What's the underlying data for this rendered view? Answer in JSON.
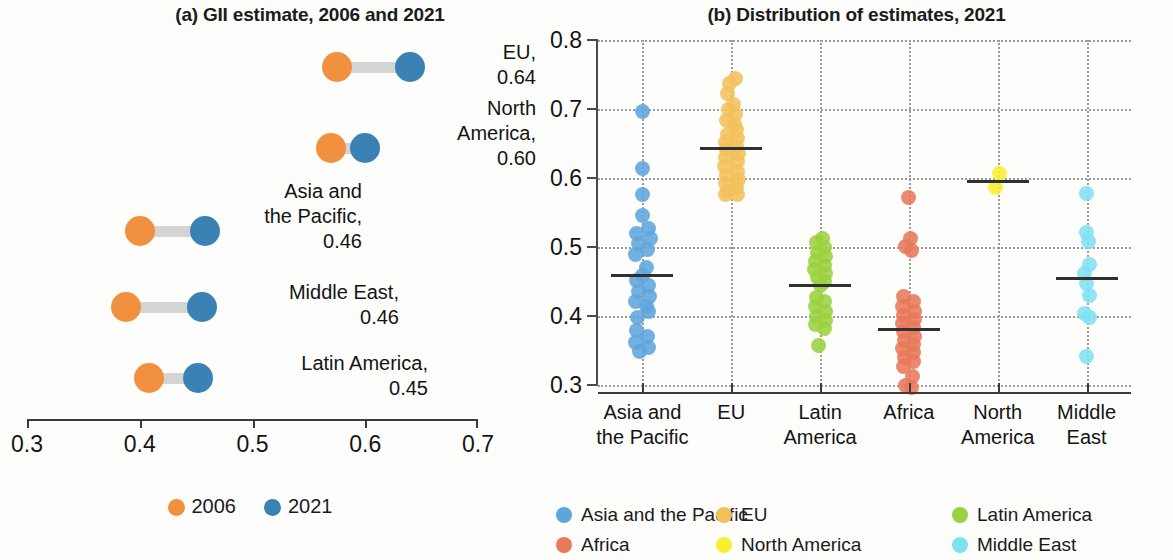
{
  "panel_a": {
    "title": "(a) GII estimate, 2006 and 2021",
    "axis": {
      "min": 0.3,
      "max": 0.7,
      "ticks": [
        "0.3",
        "0.4",
        "0.5",
        "0.6",
        "0.7"
      ]
    },
    "rows": [
      {
        "label": "EU,\n0.64",
        "v2006": 0.575,
        "v2021": 0.64,
        "top": 52,
        "label_x": 432,
        "label_y": 40,
        "label_w": 104
      },
      {
        "label": "North\nAmerica,\n0.60",
        "v2006": 0.57,
        "v2021": 0.6,
        "top": 133,
        "label_x": 400,
        "label_y": 96,
        "label_w": 136
      },
      {
        "label": "Asia and\nthe Pacific,\n0.46",
        "v2006": 0.4,
        "v2021": 0.458,
        "top": 216,
        "label_x": 222,
        "label_y": 179,
        "label_w": 140
      },
      {
        "label": "Middle East,\n0.46",
        "v2006": 0.388,
        "v2021": 0.455,
        "top": 292,
        "label_x": 224,
        "label_y": 280,
        "label_w": 175
      },
      {
        "label": "Latin America,\n0.45",
        "v2006": 0.408,
        "v2021": 0.452,
        "top": 363,
        "label_x": 228,
        "label_y": 351,
        "label_w": 200
      }
    ],
    "legend": [
      {
        "label": "2006",
        "color": "#f1913f"
      },
      {
        "label": "2021",
        "color": "#3a81b4"
      }
    ]
  },
  "panel_b": {
    "title": "(b) Distribution of estimates, 2021",
    "y_ticks": [
      "0.8",
      "0.7",
      "0.6",
      "0.5",
      "0.4",
      "0.3"
    ],
    "legend": [
      {
        "label": "Asia and the Pacific",
        "color": "#5ea5dd",
        "col": 0,
        "row": 0
      },
      {
        "label": "EU",
        "color": "#f2c05a",
        "col": 1,
        "row": 0
      },
      {
        "label": "Latin America",
        "color": "#9bd13f",
        "col": 2,
        "row": 0
      },
      {
        "label": "Africa",
        "color": "#e8795a",
        "col": 0,
        "row": 1
      },
      {
        "label": "North America",
        "color": "#f7ef2f",
        "col": 1,
        "row": 1
      },
      {
        "label": "Middle East",
        "color": "#7fe1f2",
        "col": 2,
        "row": 1
      }
    ]
  },
  "chart_data": [
    {
      "type": "bar",
      "subtype": "dumbbell",
      "title": "(a) GII estimate, 2006 and 2021",
      "xlabel": "",
      "ylabel": "",
      "xlim": [
        0.3,
        0.7
      ],
      "xticks": [
        0.3,
        0.4,
        0.5,
        0.6,
        0.7
      ],
      "grid": false,
      "legend_position": "bottom",
      "categories": [
        "EU",
        "North America",
        "Asia and the Pacific",
        "Middle East",
        "Latin America"
      ],
      "series": [
        {
          "name": "2006",
          "color": "#f1913f",
          "values": [
            0.575,
            0.57,
            0.4,
            0.388,
            0.408
          ]
        },
        {
          "name": "2021",
          "color": "#3a81b4",
          "values": [
            0.64,
            0.6,
            0.458,
            0.455,
            0.452
          ]
        }
      ],
      "data_labels": [
        "0.64",
        "0.60",
        "0.46",
        "0.46",
        "0.45"
      ]
    },
    {
      "type": "scatter",
      "subtype": "strip-beeswarm",
      "title": "(b) Distribution of estimates, 2021",
      "xlabel": "",
      "ylabel": "",
      "ylim": [
        0.3,
        0.8
      ],
      "yticks": [
        0.3,
        0.4,
        0.5,
        0.6,
        0.7,
        0.8
      ],
      "grid": true,
      "legend_position": "bottom",
      "categories": [
        "Asia and the Pacific",
        "EU",
        "Latin America",
        "Africa",
        "North America",
        "Middle East"
      ],
      "series": [
        {
          "name": "Asia and the Pacific",
          "color": "#5ea5dd",
          "mean": 0.458,
          "values": [
            0.697,
            0.614,
            0.576,
            0.545,
            0.527,
            0.52,
            0.512,
            0.505,
            0.497,
            0.489,
            0.47,
            0.459,
            0.452,
            0.444,
            0.435,
            0.428,
            0.421,
            0.414,
            0.406,
            0.398,
            0.379,
            0.371,
            0.362,
            0.355,
            0.348
          ],
          "offsets": [
            0,
            0,
            0,
            0,
            6,
            -6,
            8,
            -4,
            5,
            -7,
            4,
            0,
            -6,
            6,
            -4,
            7,
            -7,
            4,
            6,
            -5,
            -6,
            5,
            -7,
            6,
            -3
          ]
        },
        {
          "name": "EU",
          "color": "#f2c05a",
          "mean": 0.643,
          "values": [
            0.744,
            0.737,
            0.722,
            0.706,
            0.699,
            0.692,
            0.684,
            0.677,
            0.67,
            0.663,
            0.657,
            0.651,
            0.646,
            0.641,
            0.636,
            0.63,
            0.624,
            0.617,
            0.61,
            0.604,
            0.598,
            0.592,
            0.586,
            0.58,
            0.576,
            0.576
          ],
          "offsets": [
            4,
            -2,
            -4,
            2,
            -3,
            4,
            -5,
            3,
            5,
            -4,
            6,
            -6,
            5,
            -5,
            7,
            -6,
            6,
            -7,
            6,
            -5,
            7,
            -6,
            5,
            -4,
            6,
            -6
          ]
        },
        {
          "name": "Latin America",
          "color": "#9bd13f",
          "mean": 0.444,
          "values": [
            0.512,
            0.506,
            0.499,
            0.492,
            0.486,
            0.479,
            0.473,
            0.468,
            0.462,
            0.456,
            0.45,
            0.444,
            0.427,
            0.421,
            0.414,
            0.407,
            0.4,
            0.394,
            0.388,
            0.382,
            0.357
          ],
          "offsets": [
            2,
            -4,
            4,
            -3,
            5,
            -5,
            4,
            -6,
            5,
            -3,
            4,
            0,
            -4,
            4,
            -5,
            5,
            -4,
            5,
            -5,
            4,
            -2
          ]
        },
        {
          "name": "Africa",
          "color": "#e8795a",
          "mean": 0.38,
          "values": [
            0.572,
            0.512,
            0.501,
            0.495,
            0.428,
            0.421,
            0.414,
            0.407,
            0.401,
            0.395,
            0.389,
            0.383,
            0.377,
            0.371,
            0.365,
            0.359,
            0.353,
            0.347,
            0.34,
            0.334,
            0.327,
            0.313,
            0.3,
            0.296
          ],
          "offsets": [
            0,
            2,
            -3,
            3,
            -5,
            5,
            -6,
            6,
            -5,
            6,
            -6,
            5,
            -5,
            6,
            -4,
            5,
            -6,
            5,
            -4,
            5,
            -5,
            4,
            -3,
            3
          ]
        },
        {
          "name": "North America",
          "color": "#f7ef2f",
          "mean": 0.595,
          "values": [
            0.607,
            0.586
          ],
          "offsets": [
            2,
            -2
          ]
        },
        {
          "name": "Middle East",
          "color": "#7fe1f2",
          "mean": 0.455,
          "values": [
            0.577,
            0.521,
            0.508,
            0.474,
            0.462,
            0.447,
            0.43,
            0.404,
            0.398,
            0.341
          ],
          "offsets": [
            0,
            0,
            2,
            3,
            -2,
            0,
            3,
            -2,
            3,
            0
          ]
        }
      ]
    }
  ]
}
